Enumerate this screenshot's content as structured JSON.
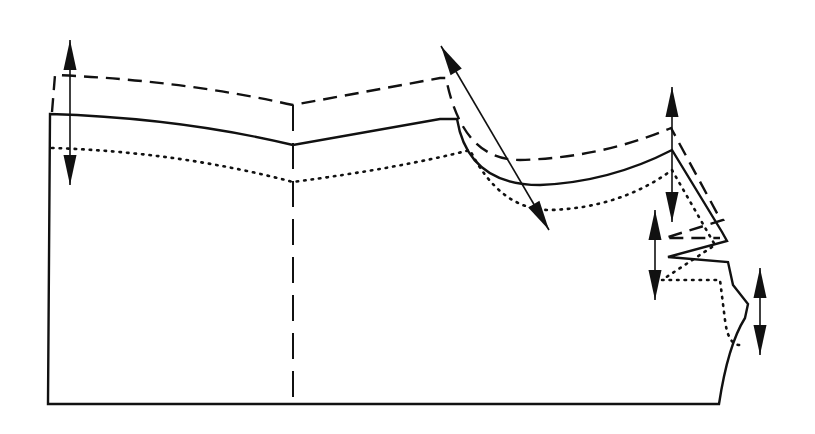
{
  "diagram": {
    "type": "pattern-grading-diagram",
    "legend": {
      "solid": "base size outline",
      "dashed": "larger size outline",
      "dotted": "smaller size outline"
    },
    "colors": {
      "stroke": "#111111",
      "background": "#ffffff"
    },
    "outlines": {
      "base_solid": "M48,404 L50,114 Q180,118 293,145 L440,119 L457,119 Q468,185 540,185 Q610,182 672,150 L722,232 L727,241 L668,257 L728,262 L733,285 L748,304 L745,318 Q728,345 719,404 Z",
      "large_dashed": "M52,112 L55,75 Q180,80 293,105 L440,78 L446,78 Q462,160 520,160 Q600,158 671,128 L718,215 L723,220 L665,238 L720,238",
      "small_dotted": "M52,148 Q180,152 293,182 Q400,168 470,150 Q500,210 550,210 Q620,208 672,170 L715,245 L662,280 L720,280 L725,320 Q728,345 740,345"
    },
    "center_seam": {
      "x": 293,
      "y_top": 105,
      "y_bottom": 404
    },
    "arrows": [
      {
        "name": "grading-arrow-left-vertical",
        "x1": 70,
        "y1": 40,
        "x2": 70,
        "y2": 185
      },
      {
        "name": "grading-arrow-shoulder-diagonal",
        "x1": 441,
        "y1": 46,
        "x2": 549,
        "y2": 230
      },
      {
        "name": "grading-arrow-underarm-vertical",
        "x1": 672,
        "y1": 87,
        "x2": 672,
        "y2": 222
      },
      {
        "name": "grading-arrow-side-vertical",
        "x1": 655,
        "y1": 210,
        "x2": 655,
        "y2": 300
      },
      {
        "name": "grading-arrow-hem-vertical",
        "x1": 760,
        "y1": 268,
        "x2": 760,
        "y2": 355
      }
    ]
  }
}
